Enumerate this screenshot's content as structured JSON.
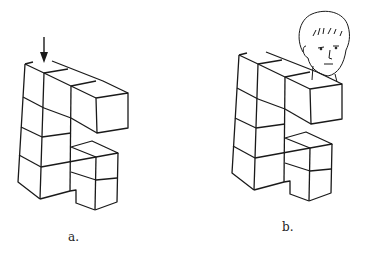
{
  "figures": [
    {
      "id": "a",
      "label": "a.",
      "description": "Block structure of stacked cubes viewed with an arrow indicating a viewpoint from above"
    },
    {
      "id": "b",
      "label": "b.",
      "description": "Same block structure with a person's head showing the viewer position"
    }
  ],
  "colors": {
    "stroke": "#1a1a1a",
    "background": "#ffffff"
  }
}
